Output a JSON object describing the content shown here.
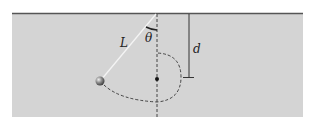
{
  "diagram": {
    "labels": {
      "length": "L",
      "angle": "θ",
      "distance": "d"
    },
    "colors": {
      "background": "#d4d4d4",
      "ceiling": "#555555",
      "string": "#f2f2f2",
      "dashed": "#333333",
      "ball": "#6a6a6a"
    }
  }
}
